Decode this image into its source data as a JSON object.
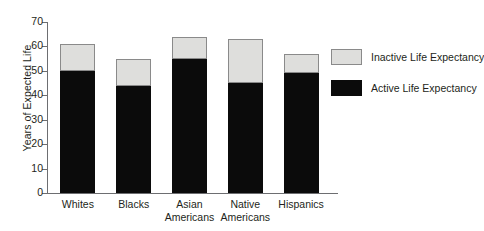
{
  "chart_data": {
    "type": "bar",
    "stacked": true,
    "title": "",
    "subtitle": "",
    "xlabel": "",
    "ylabel": "Years of Expected Life",
    "ylim": [
      0,
      70
    ],
    "yticks": [
      0,
      10,
      20,
      30,
      40,
      50,
      60,
      70
    ],
    "ytick_labels": [
      "0",
      "10",
      "20",
      "30",
      "40",
      "50",
      "60",
      "70"
    ],
    "grid": false,
    "legend_position": "right",
    "categories": [
      "Whites",
      "Blacks",
      "Asian\nAmericans",
      "Native\nAmericans",
      "Hispanics"
    ],
    "series": [
      {
        "name": "Active Life Expectancy",
        "color": "#0b0b0b",
        "values": [
          50,
          44,
          55,
          45,
          49
        ]
      },
      {
        "name": "Inactive Life Expectancy",
        "color": "#dededc",
        "values": [
          11,
          11,
          9,
          18,
          8
        ]
      }
    ],
    "totals": [
      61,
      55,
      64,
      63,
      57
    ]
  },
  "legend": {
    "items": [
      {
        "label": "Inactive Life Expectancy",
        "swatch": "inactive"
      },
      {
        "label": "Active Life Expectancy",
        "swatch": "active"
      }
    ]
  },
  "colors": {
    "active": "#0b0b0b",
    "inactive": "#dededc",
    "axis": "#6d6e71",
    "text": "#231f20",
    "background": "#ffffff"
  }
}
